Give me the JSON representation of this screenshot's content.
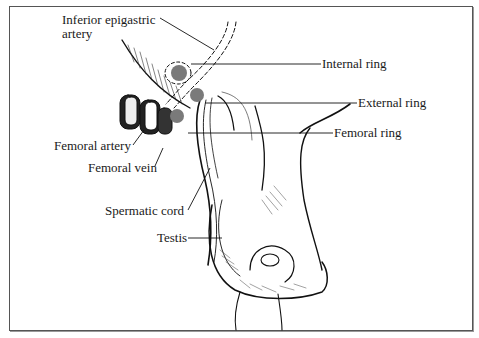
{
  "figure": {
    "type": "anatomical-illustration",
    "marker_color": "#7a7a7a",
    "signature": "Rossi"
  },
  "labels": {
    "inferior_epigastric_line1": "Inferior epigastric",
    "inferior_epigastric_line2": "artery",
    "internal_ring": "Internal ring",
    "external_ring": "External ring",
    "femoral_ring": "Femoral ring",
    "femoral_artery": "Femoral artery",
    "femoral_vein": "Femoral vein",
    "spermatic_cord": "Spermatic cord",
    "testis": "Testis"
  }
}
